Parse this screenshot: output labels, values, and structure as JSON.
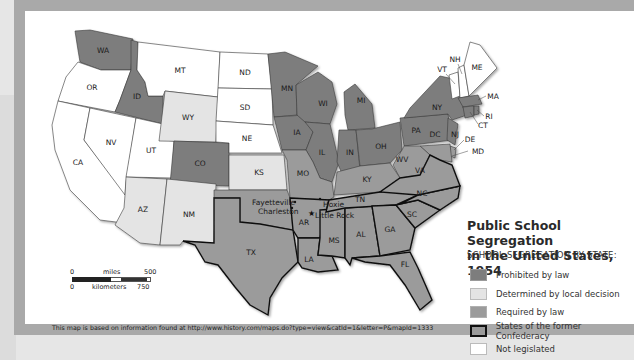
{
  "title_line1": "Public School Segregation",
  "title_line2": "in the United States, 1954",
  "legend": {
    "heading": "SCHOOL SEGREGATION BY STATE:",
    "items": [
      {
        "label": "Prohibited by law",
        "color": "#7d7d7d",
        "border": "#9a9a9a"
      },
      {
        "label": "Determined by local decision",
        "color": "#e4e4e4",
        "border": "#bdbdbd"
      },
      {
        "label": "Required by law",
        "color": "#9b9b9b",
        "border": "#b0b0b0"
      },
      {
        "label": "States of the former Confederacy",
        "color": "#9b9b9b",
        "border": "#111111"
      },
      {
        "label": "Not legislated",
        "color": "#ffffff",
        "border": "#bdbdbd"
      }
    ]
  },
  "colors": {
    "prohibited": "#7d7d7d",
    "local": "#e4e4e4",
    "required": "#9b9b9b",
    "none": "#ffffff"
  },
  "states": {
    "WA": "WA",
    "OR": "OR",
    "CA": "CA",
    "ID": "ID",
    "NV": "NV",
    "UT": "UT",
    "AZ": "AZ",
    "MT": "MT",
    "WY": "WY",
    "CO": "CO",
    "NM": "NM",
    "ND": "ND",
    "SD": "SD",
    "NE": "NE",
    "KS": "KS",
    "TX": "TX",
    "MN": "MN",
    "IA": "IA",
    "MO": "MO",
    "AR": "AR",
    "LA": "LA",
    "WI": "WI",
    "IL": "IL",
    "MI": "MI",
    "IN": "IN",
    "OH": "OH",
    "KY": "KY",
    "TN": "TN",
    "MS": "MS",
    "AL": "AL",
    "GA": "GA",
    "FL": "FL",
    "SC": "SC",
    "NC": "NC",
    "VA": "VA",
    "WV": "WV",
    "PA": "PA",
    "NY": "NY",
    "VT": "VT",
    "NH": "NH",
    "ME": "ME",
    "MA": "MA",
    "RI": "RI",
    "CT": "CT",
    "NJ": "NJ",
    "DE": "DE",
    "MD": "MD",
    "DC": "DC"
  },
  "cities": {
    "fayetteville": "Fayetteville",
    "charleston": "Charleston",
    "hoxie": "Hoxie",
    "little_rock": "Little Rock"
  },
  "scale": {
    "miles_label": "miles",
    "miles_start": "0",
    "miles_end": "500",
    "km_label": "kilometers",
    "km_start": "0",
    "km_end": "750"
  },
  "credit": "This map is based on information found at http://www.history.com/maps.do?type=view&catId=1&letter=P&mapId=1333"
}
